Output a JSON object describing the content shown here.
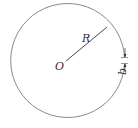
{
  "diagram": {
    "title": "",
    "labels": {
      "center": "O",
      "radius": "R",
      "gap": "b"
    },
    "colors": {
      "stroke": "#8a8a8a",
      "line": "#333333",
      "text": "#333333"
    }
  }
}
